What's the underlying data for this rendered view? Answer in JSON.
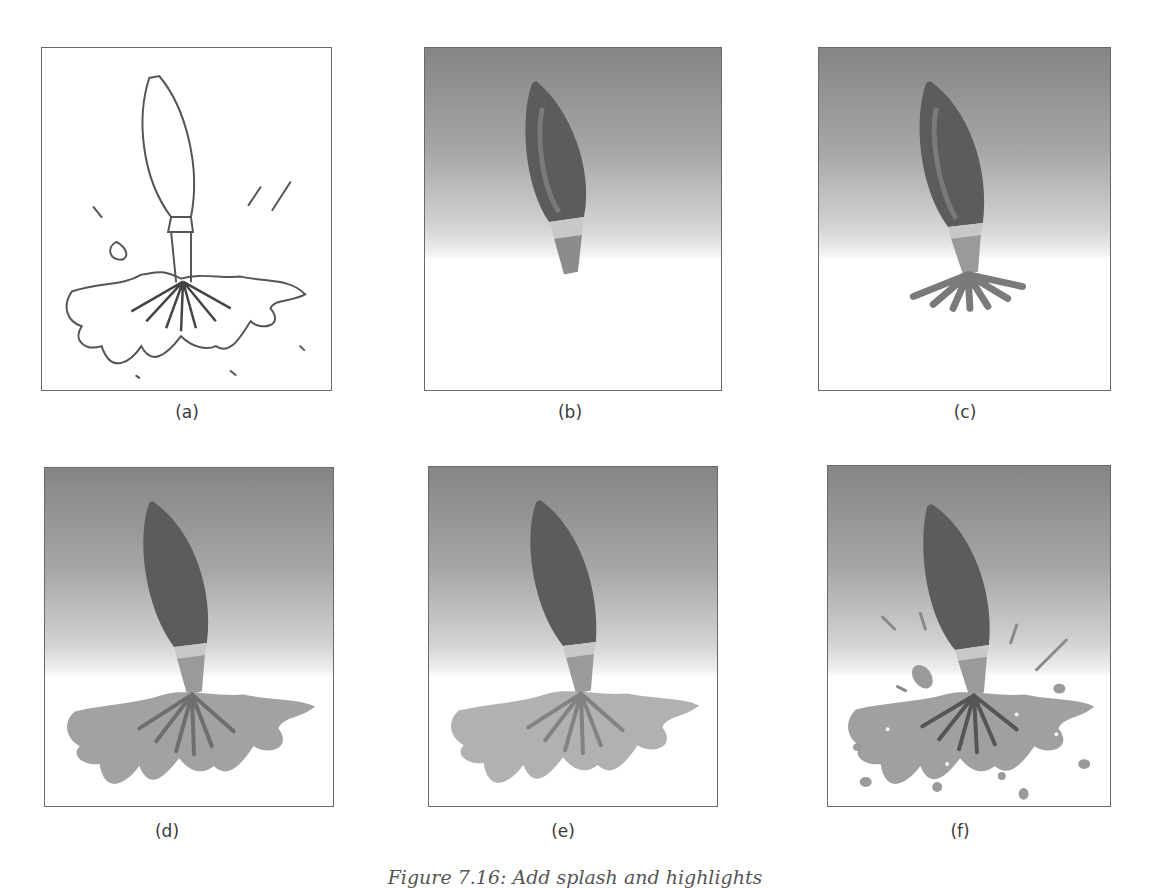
{
  "figure": {
    "caption": "Figure 7.16: Add splash and highlights",
    "panels": [
      {
        "id": "a",
        "label": "(a)",
        "description": "pencil sketch of brush splashing into paint"
      },
      {
        "id": "b",
        "label": "(b)",
        "description": "brush body painted on gradient background"
      },
      {
        "id": "c",
        "label": "(c)",
        "description": "brush with bristles spreading"
      },
      {
        "id": "d",
        "label": "(d)",
        "description": "paint splash pool added"
      },
      {
        "id": "e",
        "label": "(e)",
        "description": "splash softened"
      },
      {
        "id": "f",
        "label": "(f)",
        "description": "droplets and highlights added"
      }
    ]
  },
  "colors": {
    "frame": "#6a6a6a",
    "background_top": "#858585",
    "background_bottom": "#ffffff",
    "brush_body": "#5e5e5e",
    "ferrule": "#bdbdbd",
    "paint": "#9c9c9c"
  }
}
